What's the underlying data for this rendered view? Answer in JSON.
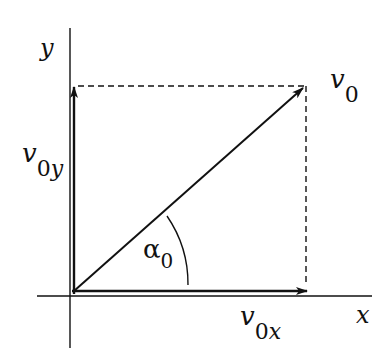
{
  "diagram": {
    "axes": {
      "x_label": "x",
      "y_label": "y"
    },
    "vectors": {
      "v0": {
        "symbol": "v",
        "subscript": "0"
      },
      "v0x": {
        "symbol": "v",
        "subscript": "0x"
      },
      "v0y": {
        "symbol": "v",
        "subscript": "0y"
      }
    },
    "angle": {
      "symbol": "α",
      "subscript": "0"
    },
    "colors": {
      "ink": "#111111",
      "background": "#ffffff"
    }
  }
}
